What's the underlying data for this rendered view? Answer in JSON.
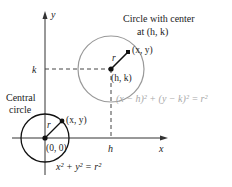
{
  "axes": {
    "x_label": "x",
    "y_label": "y",
    "h_label": "h",
    "k_label": "k"
  },
  "shifted_circle": {
    "title_line1": "Circle with center",
    "title_line2": "at (h, k)",
    "center_label": "(h, k)",
    "point_label": "(x, y)",
    "radius_label": "r",
    "equation": "(x − h)² + (y − k)² = r²",
    "color": "#999999"
  },
  "central_circle": {
    "title_line1": "Central",
    "title_line2": "circle",
    "center_label": "(0, 0)",
    "point_label": "(x, y)",
    "radius_label": "r",
    "equation": "x² + y² = r²",
    "color": "#111111"
  }
}
